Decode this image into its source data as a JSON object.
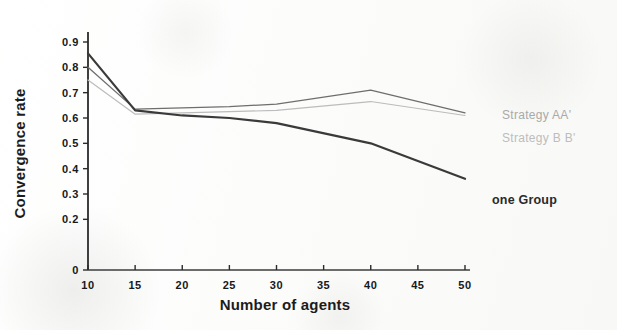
{
  "chart_data": {
    "type": "line",
    "title": "",
    "xlabel": "Number of agents",
    "ylabel": "Convergence rate",
    "xlim": [
      10,
      50
    ],
    "ylim": [
      0,
      0.9
    ],
    "grid": false,
    "legend_position": "right-inline",
    "xticks": [
      10,
      15,
      20,
      25,
      30,
      35,
      40,
      45,
      50
    ],
    "xtick_labels": [
      "10",
      "15",
      "20",
      "25",
      "30",
      "35",
      "40",
      "45",
      "50"
    ],
    "yticks": [
      0,
      0.2,
      0.3,
      0.4,
      0.5,
      0.6,
      0.7,
      0.8,
      0.9
    ],
    "ytick_labels": [
      "0",
      "0.2",
      "0.3",
      "0.4",
      "0.5",
      "0.6",
      "0.7",
      "0.8",
      "0.9"
    ],
    "x": [
      10,
      15,
      20,
      25,
      30,
      40,
      50
    ],
    "series": [
      {
        "name": "Strategy AA'",
        "color": "#6e6e6e",
        "width": 1.3,
        "values": [
          0.8,
          0.635,
          0.64,
          0.645,
          0.655,
          0.71,
          0.62
        ]
      },
      {
        "name": "Strategy B B'",
        "color": "#bcbcbc",
        "width": 1.2,
        "values": [
          0.75,
          0.615,
          0.62,
          0.625,
          0.63,
          0.665,
          0.61
        ]
      },
      {
        "name": "one Group",
        "color": "#3a3a3a",
        "width": 2.2,
        "values": [
          0.855,
          0.63,
          0.61,
          0.6,
          0.58,
          0.5,
          0.36
        ]
      }
    ],
    "annotations": [
      {
        "text": "Strategy AA'",
        "x_px": 502,
        "y_px": 108
      },
      {
        "text": "Strategy B B'",
        "x_px": 502,
        "y_px": 131
      },
      {
        "text": "one Group",
        "x_px": 492,
        "y_px": 193
      }
    ]
  },
  "axes": {
    "y_title": "Convergence rate",
    "x_title": "Number of agents"
  }
}
